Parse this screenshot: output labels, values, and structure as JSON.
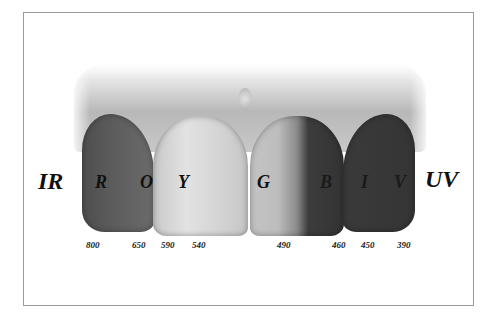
{
  "diagram": {
    "ends": {
      "left": "IR",
      "right": "UV"
    },
    "bands": [
      {
        "letter": "R",
        "name": "red"
      },
      {
        "letter": "O",
        "name": "orange"
      },
      {
        "letter": "Y",
        "name": "yellow"
      },
      {
        "letter": "G",
        "name": "green"
      },
      {
        "letter": "B",
        "name": "blue"
      },
      {
        "letter": "I",
        "name": "indigo"
      },
      {
        "letter": "V",
        "name": "violet"
      }
    ],
    "wavelengths": [
      "800",
      "650",
      "590",
      "540",
      "490",
      "460",
      "450",
      "390"
    ],
    "teeth": [
      {
        "id": "tooth-1",
        "labels": [
          "R",
          "O"
        ],
        "tone": "#5a5a5a"
      },
      {
        "id": "tooth-2",
        "labels": [
          "Y"
        ],
        "tone": "#d8d8d8"
      },
      {
        "id": "tooth-3",
        "labels": [
          "G",
          "B"
        ],
        "tone": "gradient light-to-dark"
      },
      {
        "id": "tooth-4",
        "labels": [
          "I",
          "V"
        ],
        "tone": "#383838"
      }
    ]
  }
}
